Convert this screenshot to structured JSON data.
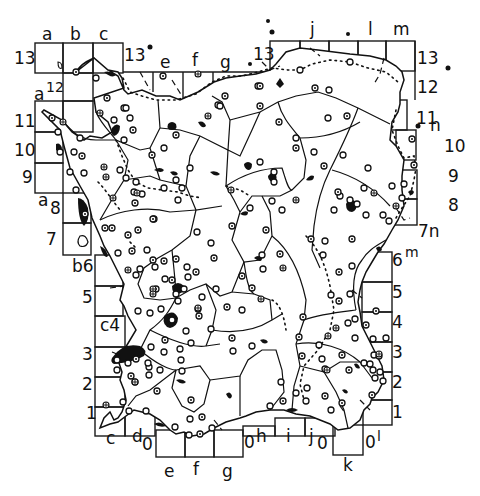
{
  "map": {
    "title": "",
    "grid_labels": {
      "top_columns": [
        "a",
        "b",
        "c",
        "e",
        "f",
        "g",
        "j",
        "l",
        "m"
      ],
      "top_rows": [
        "13",
        "13",
        "13",
        "13"
      ],
      "left_rows": [
        "13",
        "a12",
        "11",
        "10",
        "9",
        "a8",
        "7",
        "b6",
        "5",
        "c4",
        "3",
        "2",
        "1"
      ],
      "right_rows": [
        "13",
        "12",
        "11n",
        "10",
        "9",
        "8",
        "7n",
        "6m",
        "5",
        "4",
        "3",
        "2",
        "1"
      ],
      "bottom_columns": [
        "c",
        "d0",
        "e",
        "f",
        "g",
        "0h",
        "i",
        "j0",
        "k",
        "0l"
      ]
    },
    "labels": [
      {
        "id": "a-top",
        "text": "a",
        "x": 48,
        "y": 40
      },
      {
        "id": "b-top",
        "text": "b",
        "x": 78,
        "y": 40
      },
      {
        "id": "c-top",
        "text": "c",
        "x": 106,
        "y": 40
      },
      {
        "id": "13-left",
        "text": "13",
        "x": 18,
        "y": 64
      },
      {
        "id": "13-c",
        "text": "13",
        "x": 126,
        "y": 60
      },
      {
        "id": "e-top",
        "text": "e",
        "x": 164,
        "y": 68
      },
      {
        "id": "f-top",
        "text": "f",
        "x": 196,
        "y": 64
      },
      {
        "id": "g-top",
        "text": "g",
        "x": 224,
        "y": 68
      },
      {
        "id": "13-j",
        "text": "13",
        "x": 256,
        "y": 60
      },
      {
        "id": "j-top",
        "text": "j",
        "x": 314,
        "y": 36
      },
      {
        "id": "l-top",
        "text": "l",
        "x": 370,
        "y": 36
      },
      {
        "id": "m-top",
        "text": "m",
        "x": 397,
        "y": 36
      },
      {
        "id": "13-right",
        "text": "13",
        "x": 419,
        "y": 64
      },
      {
        "id": "12-right",
        "text": "12",
        "x": 419,
        "y": 93
      },
      {
        "id": "a12-left",
        "text": "a",
        "x": 36,
        "y": 98
      },
      {
        "id": "12-left",
        "text": "12",
        "x": 47,
        "y": 92
      },
      {
        "id": "11-left",
        "text": "11",
        "x": 18,
        "y": 127
      },
      {
        "id": "11-right",
        "text": "11",
        "x": 418,
        "y": 124
      },
      {
        "id": "n-right",
        "text": "n",
        "x": 432,
        "y": 130
      },
      {
        "id": "10-left",
        "text": "10",
        "x": 18,
        "y": 156
      },
      {
        "id": "10-right",
        "text": "10",
        "x": 446,
        "y": 152
      },
      {
        "id": "9-left",
        "text": "9",
        "x": 24,
        "y": 182
      },
      {
        "id": "9-right",
        "text": "9",
        "x": 450,
        "y": 181
      },
      {
        "id": "a8-left",
        "text": "a",
        "x": 40,
        "y": 204
      },
      {
        "id": "8-left",
        "text": "8",
        "x": 52,
        "y": 212
      },
      {
        "id": "8-right",
        "text": "8",
        "x": 450,
        "y": 210
      },
      {
        "id": "7-left",
        "text": "7",
        "x": 48,
        "y": 244
      },
      {
        "id": "7n-right",
        "text": "7n",
        "x": 420,
        "y": 236
      },
      {
        "id": "b6-left",
        "text": "b6",
        "x": 72,
        "y": 270
      },
      {
        "id": "6m-right",
        "text": "6",
        "x": 393,
        "y": 264
      },
      {
        "id": "m6-sup",
        "text": "m",
        "x": 406,
        "y": 256
      },
      {
        "id": "5-left",
        "text": "5",
        "x": 82,
        "y": 302
      },
      {
        "id": "5-right",
        "text": "5",
        "x": 393,
        "y": 297
      },
      {
        "id": "c4-left",
        "text": "c4",
        "x": 100,
        "y": 330
      },
      {
        "id": "4-right",
        "text": "4",
        "x": 393,
        "y": 327
      },
      {
        "id": "3-left",
        "text": "3",
        "x": 84,
        "y": 359
      },
      {
        "id": "3-right",
        "text": "3",
        "x": 393,
        "y": 357
      },
      {
        "id": "2-left",
        "text": "2",
        "x": 84,
        "y": 389
      },
      {
        "id": "2-right",
        "text": "2",
        "x": 393,
        "y": 387
      },
      {
        "id": "1-left",
        "text": "1",
        "x": 86,
        "y": 418
      },
      {
        "id": "1-right",
        "text": "1",
        "x": 393,
        "y": 417
      },
      {
        "id": "c-bottom",
        "text": "c",
        "x": 107,
        "y": 443
      },
      {
        "id": "d-bottom",
        "text": "d",
        "x": 133,
        "y": 441
      },
      {
        "id": "0-d",
        "text": "0",
        "x": 143,
        "y": 448
      },
      {
        "id": "e-bottom",
        "text": "e",
        "x": 165,
        "y": 476
      },
      {
        "id": "f-bottom",
        "text": "f",
        "x": 193,
        "y": 474
      },
      {
        "id": "g-bottom",
        "text": "g",
        "x": 222,
        "y": 476
      },
      {
        "id": "0-h",
        "text": "0",
        "x": 245,
        "y": 447
      },
      {
        "id": "h-bottom",
        "text": "h",
        "x": 257,
        "y": 441
      },
      {
        "id": "i-bottom",
        "text": "i",
        "x": 285,
        "y": 441
      },
      {
        "id": "j-bottom",
        "text": "j",
        "x": 309,
        "y": 441
      },
      {
        "id": "0-j",
        "text": "0",
        "x": 318,
        "y": 448
      },
      {
        "id": "k-bottom",
        "text": "k",
        "x": 343,
        "y": 470
      },
      {
        "id": "0-l",
        "text": "0",
        "x": 365,
        "y": 447
      },
      {
        "id": "l-bottom",
        "text": "l",
        "x": 377,
        "y": 440
      }
    ],
    "legend": {
      "symbols": [
        "open-circle-site",
        "dot-in-circle-site",
        "cross-in-circle-site",
        "solid-blob-settlement",
        "solid-dot"
      ]
    }
  }
}
